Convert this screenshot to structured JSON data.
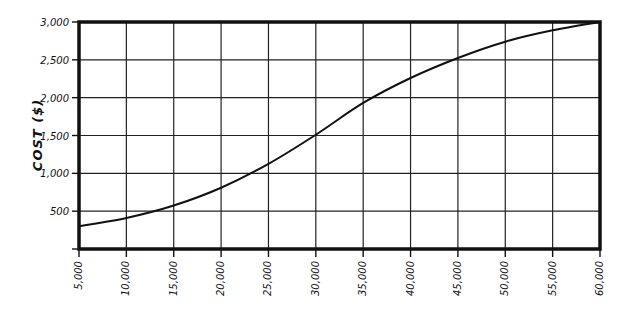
{
  "chart_data": {
    "type": "line",
    "title": "",
    "xlabel": "",
    "ylabel": "COST ($)",
    "x": [
      5000,
      10000,
      15000,
      20000,
      25000,
      30000,
      35000,
      40000,
      45000,
      50000,
      55000,
      60000
    ],
    "series": [
      {
        "name": "Cost",
        "values": [
          300,
          410,
          575,
          810,
          1125,
          1510,
          1930,
          2260,
          2525,
          2740,
          2890,
          3000
        ]
      }
    ],
    "x_tick_labels": [
      "5,000",
      "10,000",
      "15,000",
      "20,000",
      "25,000",
      "30,000",
      "35,000",
      "40,000",
      "45,000",
      "50,000",
      "55,000",
      "60,000"
    ],
    "y_ticks": [
      500,
      1000,
      1500,
      2000,
      2500,
      3000
    ],
    "y_tick_labels": [
      "500",
      "1,000",
      "1,500",
      "2,000",
      "2,500",
      "3,000"
    ],
    "xlim": [
      5000,
      60000
    ],
    "ylim": [
      0,
      3000
    ],
    "grid": true,
    "legend": "none",
    "line_color": "#111111"
  }
}
